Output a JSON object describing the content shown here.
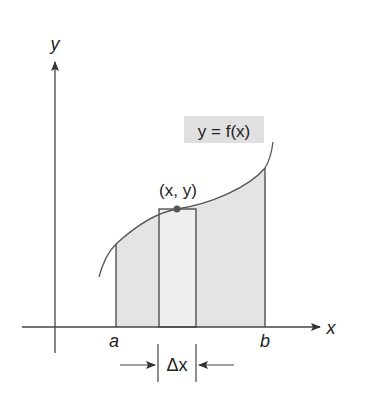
{
  "diagram": {
    "axes": {
      "x_label": "x",
      "y_label": "y"
    },
    "curve_label": "y = f(x)",
    "point_label": "(x, y)",
    "bound_left_label": "a",
    "bound_right_label": "b",
    "width_label": "Δx",
    "colors": {
      "stroke": "#444444",
      "shade": "#e4e4e4",
      "label_bg": "#e0e0e0",
      "point": "#555555"
    }
  }
}
